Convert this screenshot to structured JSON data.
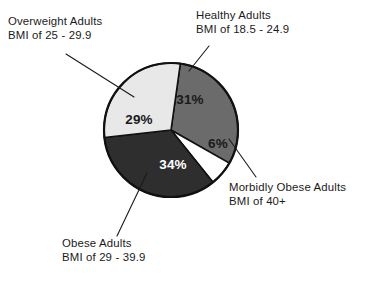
{
  "chart_data": {
    "type": "pie",
    "title": "",
    "subtitle": "",
    "xlabel": "",
    "ylabel": "",
    "legend_position": "callout-labels",
    "grid": false,
    "units": "percent",
    "total": 100,
    "start_angle_deg": 8,
    "direction": "clockwise",
    "categories": [
      "Healthy Adults",
      "Morbidly Obese Adults",
      "Obese Adults",
      "Overweight Adults"
    ],
    "values": [
      31,
      6,
      34,
      29
    ],
    "slices": [
      {
        "key": "healthy",
        "name": "Healthy Adults",
        "criteria": "BMI of 18.5 - 24.9",
        "value": 31,
        "value_label": "31%",
        "color": "#6b6b6b",
        "text_color": "#1a1a1a"
      },
      {
        "key": "morbid",
        "name": "Morbidly Obese Adults",
        "criteria": "BMI of 40+",
        "value": 6,
        "value_label": "6%",
        "color": "#ffffff",
        "text_color": "#1a1a1a"
      },
      {
        "key": "obese",
        "name": "Obese Adults",
        "criteria": "BMI of 29 - 39.9",
        "value": 34,
        "value_label": "34%",
        "color": "#2e2e2e",
        "text_color": "#ffffff"
      },
      {
        "key": "overweight",
        "name": "Overweight Adults",
        "criteria": "BMI of 25 - 29.9",
        "value": 29,
        "value_label": "29%",
        "color": "#e8e8e8",
        "text_color": "#1a1a1a"
      }
    ]
  },
  "callouts": {
    "overweight": {
      "line1": "Overweight Adults",
      "line2": "BMI of 25 - 29.9"
    },
    "healthy": {
      "line1": "Healthy Adults",
      "line2": "BMI of 18.5 - 24.9"
    },
    "morbid": {
      "line1": "Morbidly Obese Adults",
      "line2": "BMI of 40+"
    },
    "obese": {
      "line1": "Obese Adults",
      "line2": "BMI of 29 - 39.9"
    }
  },
  "slice_value_labels": {
    "healthy": "31%",
    "morbid": "6%",
    "obese": "34%",
    "overweight": "29%"
  },
  "geometry": {
    "center_x": 171,
    "center_y": 130,
    "radius": 67
  },
  "colors": {
    "healthy": "#6b6b6b",
    "morbid": "#ffffff",
    "obese": "#2e2e2e",
    "overweight": "#e8e8e8",
    "outline": "#111111",
    "text": "#1a1a1a",
    "background": "#ffffff"
  }
}
